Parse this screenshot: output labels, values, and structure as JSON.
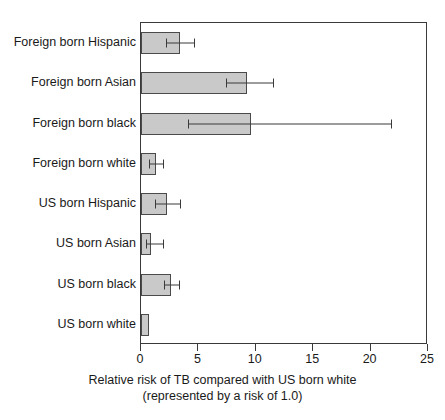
{
  "chart_data": {
    "type": "bar",
    "orientation": "horizontal",
    "title": "",
    "subtitle": "",
    "xlabel": "Relative risk of TB compared with US born white",
    "xlabel_line2": "(represented by a risk of 1.0)",
    "ylabel": "",
    "xlim": [
      0,
      25
    ],
    "xticks": [
      0,
      5,
      10,
      15,
      20,
      25
    ],
    "xtick_labels": [
      "0",
      "5",
      "10",
      "15",
      "20",
      "25"
    ],
    "grid": false,
    "legend": null,
    "bar_color": "#c9c9c9",
    "bar_edge_color": "#4a4a4a",
    "error_color": "#3a3a3a",
    "categories": [
      "Foreign born Hispanic",
      "Foreign born Asian",
      "Foreign born black",
      "Foreign born white",
      "US born Hispanic",
      "US born Asian",
      "US born black",
      "US born white"
    ],
    "values": [
      3.4,
      9.2,
      9.6,
      1.3,
      2.3,
      0.9,
      2.6,
      0.7
    ],
    "error_low": [
      2.2,
      7.4,
      4.1,
      0.7,
      1.2,
      0.4,
      2.0,
      null
    ],
    "error_high": [
      4.6,
      11.5,
      21.8,
      1.9,
      3.4,
      1.9,
      3.3,
      null
    ],
    "series": [
      {
        "name": "Relative risk of TB",
        "values": [
          3.4,
          9.2,
          9.6,
          1.3,
          2.3,
          0.9,
          2.6,
          0.7
        ]
      }
    ],
    "points": [
      {
        "category": "Foreign born Hispanic",
        "value": 3.4,
        "ci_low": 2.2,
        "ci_high": 4.6
      },
      {
        "category": "Foreign born Asian",
        "value": 9.2,
        "ci_low": 7.4,
        "ci_high": 11.5
      },
      {
        "category": "Foreign born black",
        "value": 9.6,
        "ci_low": 4.1,
        "ci_high": 21.8
      },
      {
        "category": "Foreign born white",
        "value": 1.3,
        "ci_low": 0.7,
        "ci_high": 1.9
      },
      {
        "category": "US born Hispanic",
        "value": 2.3,
        "ci_low": 1.2,
        "ci_high": 3.4
      },
      {
        "category": "US born Asian",
        "value": 0.9,
        "ci_low": 0.4,
        "ci_high": 1.9
      },
      {
        "category": "US born black",
        "value": 2.6,
        "ci_low": 2.0,
        "ci_high": 3.3
      },
      {
        "category": "US born white",
        "value": 0.7,
        "ci_low": null,
        "ci_high": null
      }
    ]
  }
}
